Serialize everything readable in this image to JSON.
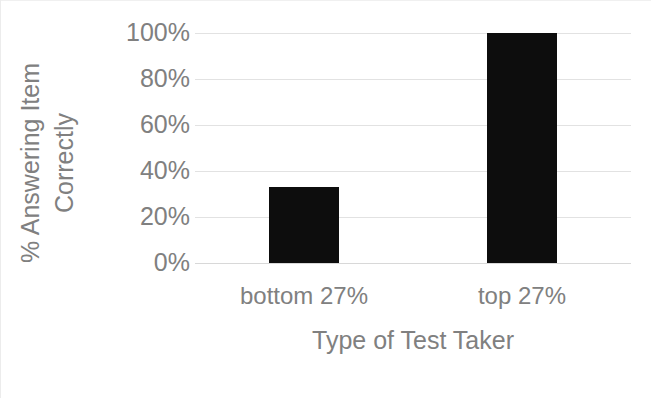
{
  "figure": {
    "background_color": "#ffffff",
    "text_color": "#808080",
    "bar_color": "#0d0d0d",
    "gridline_color": "#e2e2e2"
  },
  "y_axis_title_text": "% Answering Item Correctly",
  "x_axis_title_text": "Type of Test Taker",
  "chart_data": {
    "type": "bar",
    "title": "",
    "subtitle": "",
    "xlabel": "Type of Test Taker",
    "ylabel": "% Answering Item Correctly",
    "categories": [
      "bottom 27%",
      "top 27%"
    ],
    "values": [
      33,
      100
    ],
    "value_unit": "percent",
    "ylim": [
      0,
      100
    ],
    "ytick_values": [
      0,
      20,
      40,
      60,
      80,
      100
    ],
    "ytick_labels": [
      "0%",
      "20%",
      "40%",
      "60%",
      "80%",
      "100%"
    ],
    "grid": {
      "horizontal": true,
      "vertical": false
    },
    "legend": {
      "visible": false,
      "position": "none"
    },
    "series": [
      {
        "name": "% Answering Item Correctly",
        "color": "#0d0d0d",
        "values": [
          33,
          100
        ]
      }
    ],
    "annotations": []
  }
}
